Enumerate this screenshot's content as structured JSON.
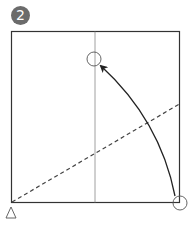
{
  "step": {
    "number": "2",
    "badge_color": "#6b6b6b"
  },
  "diagram": {
    "type": "origami-fold-step",
    "square": {
      "x": 11,
      "y": 31,
      "size": 169,
      "stroke": "#333333"
    },
    "center_crease": {
      "x": 95,
      "y1": 31,
      "y2": 203,
      "stroke": "#888888"
    },
    "valley_fold_line": {
      "x1": 11,
      "y1": 203,
      "x2": 180,
      "y2": 104,
      "style": "dashed",
      "stroke": "#444444"
    },
    "target_circle": {
      "cx": 94,
      "cy": 59,
      "r": 7
    },
    "source_circle": {
      "cx": 180,
      "cy": 203,
      "r": 7
    },
    "arrow": {
      "from": "bottom-right-corner",
      "to": "center-crease-point",
      "stroke": "#222222"
    },
    "pivot_marker": {
      "shape": "triangle",
      "x": 11,
      "y": 208
    }
  }
}
